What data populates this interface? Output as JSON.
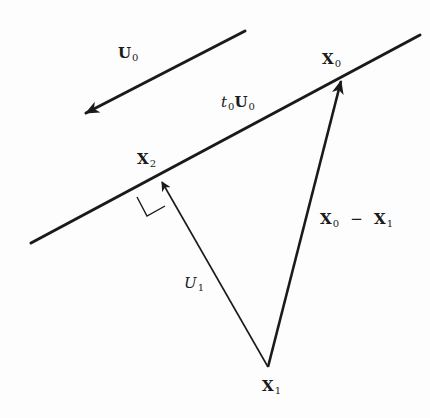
{
  "diagram": {
    "type": "vector-geometry",
    "colors": {
      "ink": "#1a1a1a",
      "background": "#fdfdfd"
    },
    "labels": {
      "u0": {
        "main": "U",
        "sub": "0"
      },
      "t0u0": {
        "prefix": "t",
        "prefix_sub": "0",
        "main": "U",
        "sub": "0"
      },
      "x0": {
        "main": "X",
        "sub": "0"
      },
      "x2": {
        "main": "X",
        "sub": "2"
      },
      "x0_minus_x1": {
        "a": "X",
        "a_sub": "0",
        "op": "−",
        "b": "X",
        "b_sub": "1"
      },
      "u1": {
        "main": "U",
        "sub": "1"
      },
      "x1": {
        "main": "X",
        "sub": "1"
      }
    },
    "elements": [
      {
        "name": "line",
        "label": "t0U0",
        "from": [
          31,
          243
        ],
        "to": [
          420,
          35
        ]
      },
      {
        "name": "direction-arrow",
        "label": "U0",
        "from": [
          245,
          31
        ],
        "to": [
          84,
          114
        ]
      },
      {
        "name": "vector",
        "label": "X0 − X1",
        "from": [
          268,
          367
        ],
        "to": [
          341,
          80
        ]
      },
      {
        "name": "vector",
        "label": "U1",
        "from": [
          268,
          367
        ],
        "to": [
          162,
          181
        ]
      },
      {
        "name": "right-angle-marker",
        "at": "X2"
      }
    ],
    "points": {
      "X0": [
        341,
        80
      ],
      "X1": [
        268,
        367
      ],
      "X2": [
        162,
        181
      ]
    }
  }
}
